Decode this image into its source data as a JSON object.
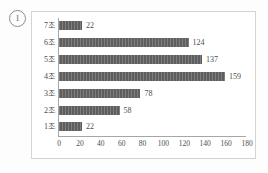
{
  "figure": {
    "item_marker": "1"
  },
  "chart_data": {
    "type": "bar",
    "orientation": "horizontal",
    "title": "",
    "subtitle": "",
    "xlabel": "",
    "ylabel": "",
    "categories": [
      "1조",
      "2조",
      "3조",
      "4조",
      "5조",
      "6조",
      "7조"
    ],
    "values": [
      22,
      58,
      78,
      159,
      137,
      124,
      22
    ],
    "data_labels": [
      "22",
      "58",
      "78",
      "159",
      "137",
      "124",
      "22"
    ],
    "xlim": [
      0,
      180
    ],
    "xticks": [
      0,
      20,
      40,
      60,
      80,
      100,
      120,
      140,
      160,
      180
    ],
    "xtick_labels": [
      "0",
      "20",
      "40",
      "60",
      "80",
      "100",
      "120",
      "140",
      "160",
      "180"
    ],
    "grid": false,
    "legend": null,
    "legend_position": "none",
    "bar_color": "#5e5e5e",
    "axis_color": "#a6a6a6",
    "text_color": "#4d4d4d",
    "background_color": "#ffffff"
  }
}
